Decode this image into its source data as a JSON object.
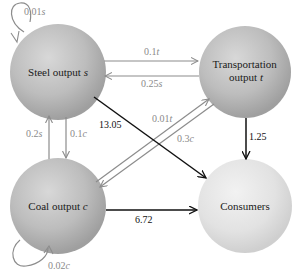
{
  "diagram": {
    "type": "flow-network",
    "nodes": [
      {
        "id": "steel",
        "label_main": "Steel output ",
        "label_var": "s"
      },
      {
        "id": "transport",
        "label_line1": "Transportation",
        "label_line2_main": "output ",
        "label_var": "t"
      },
      {
        "id": "coal",
        "label_main": "Coal output ",
        "label_var": "c"
      },
      {
        "id": "consumers",
        "label_main": "Consumers"
      }
    ],
    "edges": [
      {
        "id": "steel-self",
        "from": "steel",
        "to": "steel",
        "coef": "0.01",
        "var": "s",
        "style": "gray"
      },
      {
        "id": "transport-to-steel-out",
        "from": "steel",
        "to": "transport",
        "coef": "0.1",
        "var": "t",
        "style": "gray"
      },
      {
        "id": "steel-to-transport-in",
        "from": "transport",
        "to": "steel",
        "coef": "0.25",
        "var": "s",
        "style": "gray"
      },
      {
        "id": "coal-to-steel",
        "from": "coal",
        "to": "steel",
        "coef": "0.2",
        "var": "s",
        "style": "gray"
      },
      {
        "id": "steel-to-coal",
        "from": "steel",
        "to": "coal",
        "coef": "0.1",
        "var": "c",
        "style": "gray"
      },
      {
        "id": "coal-to-transport",
        "from": "coal",
        "to": "transport",
        "coef": "0.01",
        "var": "t",
        "style": "gray"
      },
      {
        "id": "transport-to-coal",
        "from": "transport",
        "to": "coal",
        "coef": "0.3",
        "var": "c",
        "style": "gray"
      },
      {
        "id": "coal-self",
        "from": "coal",
        "to": "coal",
        "coef": "0.02",
        "var": "c",
        "style": "gray"
      },
      {
        "id": "steel-to-consumers",
        "from": "steel",
        "to": "consumers",
        "value": "13.05",
        "style": "black"
      },
      {
        "id": "transport-to-consumers",
        "from": "transport",
        "to": "consumers",
        "value": "1.25",
        "style": "black"
      },
      {
        "id": "coal-to-consumers",
        "from": "coal",
        "to": "consumers",
        "value": "6.72",
        "style": "black"
      }
    ],
    "colors": {
      "gray_arrow": "#8c8c8c",
      "black_arrow": "#111111",
      "sphere_dark": "#a9a9a9",
      "sphere_light": "#dcdcdc"
    }
  }
}
